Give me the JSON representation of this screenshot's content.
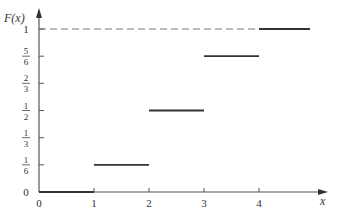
{
  "chart_data": {
    "type": "line",
    "subtype": "step",
    "title": "",
    "xlabel": "x",
    "ylabel": "F(x)",
    "xlim": [
      0,
      5
    ],
    "ylim": [
      0,
      1
    ],
    "x_ticks": [
      "0",
      "1",
      "2",
      "3",
      "4"
    ],
    "y_ticks": [
      {
        "value": 0,
        "label": "0"
      },
      {
        "value": 0.1667,
        "num": "1",
        "den": "6"
      },
      {
        "value": 0.3333,
        "num": "1",
        "den": "3"
      },
      {
        "value": 0.5,
        "num": "1",
        "den": "2"
      },
      {
        "value": 0.6667,
        "num": "2",
        "den": "3"
      },
      {
        "value": 0.8333,
        "num": "5",
        "den": "6"
      },
      {
        "value": 1,
        "label": "1"
      }
    ],
    "segments": [
      {
        "x_start": 0,
        "x_end": 1,
        "y": 0
      },
      {
        "x_start": 1,
        "x_end": 2,
        "y": 0.1667
      },
      {
        "x_start": 2,
        "x_end": 3,
        "y": 0.5
      },
      {
        "x_start": 3,
        "x_end": 4,
        "y": 0.8333
      },
      {
        "x_start": 4,
        "x_end": 5,
        "y": 1
      }
    ],
    "reference_line": {
      "y": 1,
      "style": "dashed",
      "x_start": 0,
      "x_end": 4
    },
    "grid": false,
    "legend": null
  }
}
